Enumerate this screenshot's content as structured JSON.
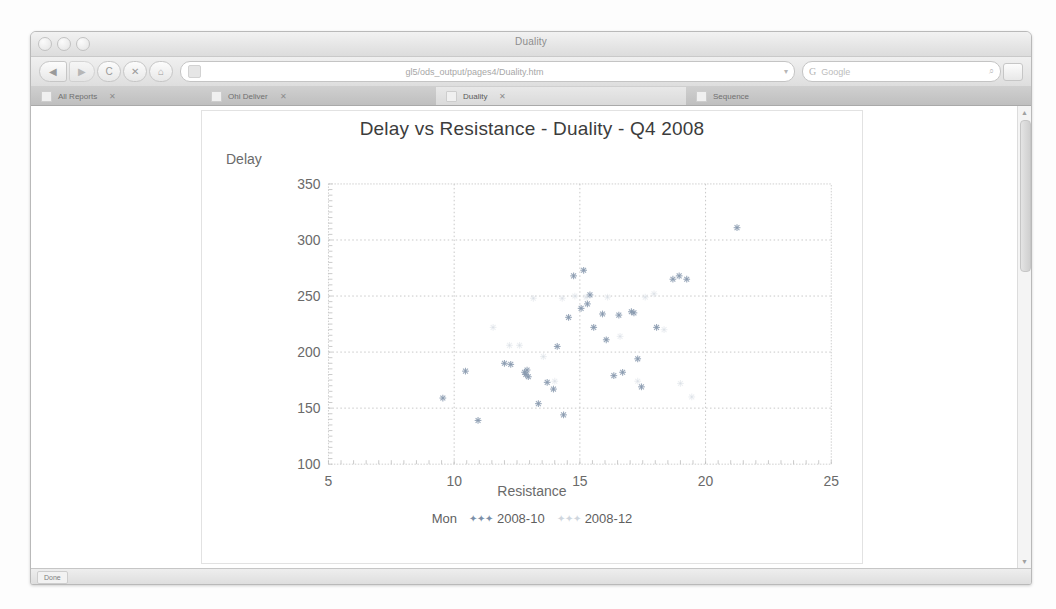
{
  "window": {
    "title": "Duality",
    "traffic_lights": [
      "close",
      "minimize",
      "zoom"
    ]
  },
  "toolbar": {
    "back_icon": "◀",
    "forward_icon": "▶",
    "reload_icon": "C",
    "stop_icon": "✕",
    "home_icon": "⌂",
    "url": "gl5/ods_output/pages4/Duality.htm",
    "url_dropdown_icon": "▾",
    "search_engine_icon": "G",
    "search_placeholder": "Google",
    "search_magnifier_icon": "⌕"
  },
  "tabs": [
    {
      "label": "All Reports",
      "close_icon": "✕",
      "active": false
    },
    {
      "label": "Ohi Deliver",
      "close_icon": "✕",
      "active": false
    },
    {
      "label": "Duality",
      "close_icon": "✕",
      "active": true
    },
    {
      "label": "Sequence",
      "close_icon": "",
      "active": false
    }
  ],
  "scrollbar": {
    "up_icon": "▲",
    "down_icon": "▼"
  },
  "statusbar": {
    "text": "Done"
  },
  "chart_data": {
    "type": "scatter",
    "title": "Delay vs Resistance - Duality - Q4 2008",
    "xlabel": "Resistance",
    "ylabel": "Delay",
    "xlim": [
      5,
      25
    ],
    "ylim": [
      100,
      350
    ],
    "xticks": [
      5,
      10,
      15,
      20,
      25
    ],
    "yticks": [
      100,
      150,
      200,
      250,
      300,
      350
    ],
    "grid": true,
    "grid_style": "dotted",
    "legend_title": "Mon",
    "legend_position": "bottom",
    "marker": "star",
    "series": [
      {
        "name": "2008-10",
        "color": "#8a9bb0",
        "marker": "star",
        "points": [
          [
            9.55,
            159
          ],
          [
            10.45,
            183
          ],
          [
            10.95,
            139
          ],
          [
            12.0,
            190
          ],
          [
            12.25,
            189
          ],
          [
            12.8,
            182
          ],
          [
            12.85,
            180
          ],
          [
            12.9,
            184
          ],
          [
            12.95,
            178
          ],
          [
            13.35,
            154
          ],
          [
            13.7,
            173
          ],
          [
            13.95,
            167
          ],
          [
            14.1,
            205
          ],
          [
            14.35,
            144
          ],
          [
            14.55,
            231
          ],
          [
            14.75,
            268
          ],
          [
            15.05,
            239
          ],
          [
            15.15,
            273
          ],
          [
            15.3,
            243
          ],
          [
            15.4,
            251
          ],
          [
            15.55,
            222
          ],
          [
            15.9,
            234
          ],
          [
            16.05,
            211
          ],
          [
            16.35,
            179
          ],
          [
            16.55,
            233
          ],
          [
            16.7,
            182
          ],
          [
            17.05,
            236
          ],
          [
            17.15,
            235
          ],
          [
            17.3,
            194
          ],
          [
            17.45,
            169
          ],
          [
            18.05,
            222
          ],
          [
            18.7,
            265
          ],
          [
            18.95,
            268
          ],
          [
            19.25,
            265
          ],
          [
            21.25,
            311
          ]
        ]
      },
      {
        "name": "2008-12",
        "color": "#d7dde4",
        "marker": "star",
        "points": [
          [
            11.55,
            222
          ],
          [
            12.2,
            206
          ],
          [
            12.6,
            206
          ],
          [
            13.15,
            248
          ],
          [
            13.55,
            196
          ],
          [
            14.0,
            174
          ],
          [
            14.3,
            248
          ],
          [
            14.8,
            250
          ],
          [
            15.25,
            249
          ],
          [
            16.1,
            249
          ],
          [
            16.6,
            214
          ],
          [
            17.3,
            174
          ],
          [
            17.6,
            249
          ],
          [
            17.95,
            252
          ],
          [
            18.35,
            220
          ],
          [
            19.0,
            172
          ],
          [
            19.45,
            160
          ]
        ]
      }
    ]
  }
}
